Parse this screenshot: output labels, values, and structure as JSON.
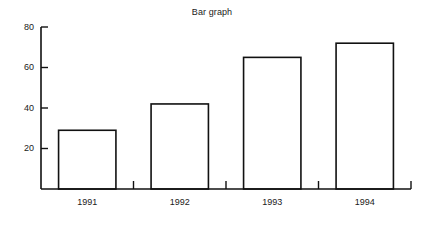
{
  "chart_data": {
    "type": "bar",
    "title": "Bar graph",
    "xlabel": "",
    "ylabel": "",
    "categories": [
      "1991",
      "1992",
      "1993",
      "1994"
    ],
    "values": [
      29,
      42,
      65,
      72
    ],
    "ylim": [
      0,
      80
    ],
    "yticks": [
      20,
      40,
      60,
      80
    ],
    "ytick_labels": [
      "20",
      "40",
      "60",
      "80"
    ],
    "grid": false,
    "legend": null,
    "bar_fill": "#ffffff",
    "bar_edge": "#111111",
    "axis_color": "#111111"
  }
}
